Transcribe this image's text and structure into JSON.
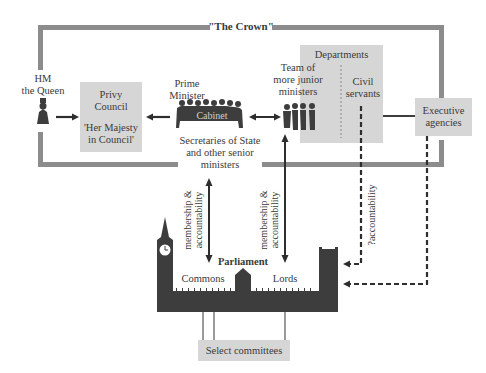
{
  "title": "\"The Crown\"",
  "nodes": {
    "queen": {
      "line1": "HM",
      "line2": "the Queen"
    },
    "privy_council": {
      "line1": "Privy",
      "line2": "Council",
      "line3": "'Her Majesty",
      "line4": "in Council'"
    },
    "prime_minister": {
      "line1": "Prime",
      "line2": "Minister"
    },
    "cabinet": {
      "label": "Cabinet"
    },
    "secretaries": {
      "line1": "Secretaries of State",
      "line2": "and other senior",
      "line3": "ministers"
    },
    "junior_ministers": {
      "line1": "Team of",
      "line2": "more junior",
      "line3": "ministers"
    },
    "departments": {
      "label": "Departments"
    },
    "civil_servants": {
      "line1": "Civil",
      "line2": "servants"
    },
    "executive_agencies": {
      "line1": "Executive",
      "line2": "agencies"
    },
    "parliament": {
      "label": "Parliament",
      "commons": "Commons",
      "lords": "Lords"
    },
    "select_committees": {
      "label": "Select committees"
    }
  },
  "edges": {
    "left_link": {
      "line1": "membership &",
      "line2": "accountability"
    },
    "right_link": {
      "line1": "membership &",
      "line2": "accountability"
    },
    "civil_link": {
      "label": "?accountability"
    }
  },
  "colors": {
    "frame": "#8c8c8c",
    "box_fill": "#d6d6d6",
    "silhouette": "#3d3d3d",
    "arrow": "#2e2e2e"
  }
}
